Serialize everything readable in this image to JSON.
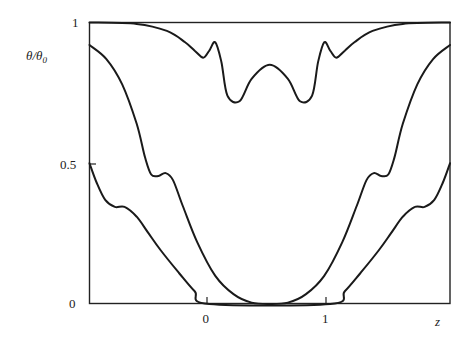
{
  "chart_data": {
    "type": "line",
    "title": "",
    "xlabel": "z",
    "ylabel": "θ/θ₀",
    "xlim": [
      -0.99,
      1.99
    ],
    "ylim": [
      0,
      1
    ],
    "grid": false,
    "legend": null,
    "x_ticks": [
      {
        "value": 0,
        "label": "0"
      },
      {
        "value": 1,
        "label": "1"
      }
    ],
    "y_ticks": [
      {
        "value": 0,
        "label": "0"
      },
      {
        "value": 0.5,
        "label": "0.5"
      },
      {
        "value": 1,
        "label": "1"
      }
    ],
    "symmetry_axis_z": 0.5,
    "series": [
      {
        "name": "upper curve",
        "x": [
          -0.99,
          -0.6,
          -0.35,
          -0.2,
          -0.12,
          -0.05,
          0.0,
          0.05,
          0.1,
          0.15,
          0.25,
          0.35,
          0.5,
          0.65,
          0.75,
          0.85,
          0.9,
          0.95,
          1.0,
          1.05,
          1.12,
          1.2,
          1.35,
          1.6,
          1.99
        ],
        "y": [
          1.0,
          0.995,
          0.97,
          0.93,
          0.9,
          0.875,
          0.9,
          0.93,
          0.86,
          0.74,
          0.72,
          0.8,
          0.85,
          0.8,
          0.72,
          0.74,
          0.86,
          0.93,
          0.9,
          0.875,
          0.9,
          0.93,
          0.97,
          0.995,
          1.0
        ]
      },
      {
        "name": "middle curve",
        "x": [
          -0.99,
          -0.85,
          -0.72,
          -0.6,
          -0.53,
          -0.48,
          -0.42,
          -0.36,
          -0.3,
          -0.22,
          -0.1,
          0.05,
          0.2,
          0.35,
          0.5,
          0.65,
          0.8,
          0.95,
          1.1,
          1.22,
          1.3,
          1.36,
          1.42,
          1.48,
          1.53,
          1.6,
          1.72,
          1.85,
          1.99
        ],
        "y": [
          0.92,
          0.87,
          0.78,
          0.64,
          0.52,
          0.46,
          0.455,
          0.465,
          0.44,
          0.35,
          0.22,
          0.1,
          0.035,
          0.005,
          0.0,
          0.005,
          0.035,
          0.1,
          0.22,
          0.35,
          0.44,
          0.465,
          0.455,
          0.46,
          0.52,
          0.64,
          0.78,
          0.87,
          0.92
        ]
      },
      {
        "name": "lower curve",
        "x": [
          -0.99,
          -0.93,
          -0.86,
          -0.78,
          -0.7,
          -0.6,
          -0.5,
          -0.4,
          -0.25,
          -0.12,
          0.0,
          1.0,
          1.12,
          1.25,
          1.4,
          1.5,
          1.6,
          1.7,
          1.78,
          1.86,
          1.93,
          1.99
        ],
        "y": [
          0.5,
          0.43,
          0.37,
          0.345,
          0.345,
          0.31,
          0.25,
          0.19,
          0.11,
          0.045,
          0.0,
          0.0,
          0.045,
          0.11,
          0.19,
          0.25,
          0.31,
          0.345,
          0.345,
          0.37,
          0.43,
          0.5
        ]
      }
    ]
  },
  "labels": {
    "y_axis": "θ/θ",
    "y_axis_sub": "0",
    "x_axis": "z",
    "y_tick_1": "1",
    "y_tick_05": "0.5",
    "y_tick_0": "0",
    "x_tick_0": "0",
    "x_tick_1": "1"
  }
}
